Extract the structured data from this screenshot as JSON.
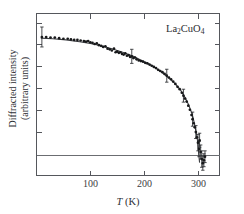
{
  "figure": {
    "background_color": "#ffffff",
    "frame_color": "#55575c",
    "point_color": "#17181a",
    "curve_color": "#3a3c40"
  },
  "annotations": {
    "sample_label": "La",
    "sample_sub_1": "2",
    "sample_mid": "CuO",
    "sample_sub_2": "4",
    "sample_label_full": "La2CuO4"
  },
  "axes": {
    "x": {
      "title_italic": "T",
      "title_rest": " (K)",
      "title_full": "T (K)",
      "ticks": [
        100,
        200,
        300
      ],
      "tick_labels": [
        "100",
        "200",
        "300"
      ],
      "range": [
        0,
        340
      ]
    },
    "y": {
      "title_line1": "Diffracted intensity",
      "title_line2": "(arbitrary units)",
      "tick_labels": [],
      "range": [
        -0.18,
        1.2
      ]
    }
  },
  "chart_data": {
    "type": "scatter",
    "title": "",
    "xlabel": "T (K)",
    "ylabel": "Diffracted intensity (arbitrary units)",
    "xlim": [
      0,
      340
    ],
    "ylim": [
      -0.18,
      1.2
    ],
    "grid": false,
    "legend": null,
    "annotation": "La2CuO4",
    "zero_line_y": 0,
    "series": [
      {
        "name": "Diffracted intensity data",
        "marker": "filled-circle",
        "x": [
          10,
          18,
          26,
          34,
          42,
          50,
          58,
          64,
          70,
          76,
          82,
          88,
          92,
          96,
          100,
          104,
          108,
          112,
          116,
          120,
          124,
          128,
          132,
          136,
          140,
          144,
          147,
          150,
          153,
          156,
          159,
          162,
          165,
          168,
          171,
          174,
          177,
          180,
          183,
          186,
          190,
          194,
          198,
          202,
          206,
          210,
          214,
          218,
          222,
          226,
          230,
          234,
          238,
          242,
          246,
          250,
          254,
          258,
          262,
          266,
          270,
          273,
          276,
          279,
          282,
          285,
          288,
          290,
          292,
          294,
          296,
          298,
          300,
          302,
          303,
          305,
          307,
          309,
          311,
          313
        ],
        "y": [
          1.0,
          1.0,
          0.995,
          0.995,
          0.99,
          0.985,
          0.985,
          0.98,
          0.975,
          0.975,
          0.97,
          0.965,
          0.96,
          0.965,
          0.955,
          0.95,
          0.94,
          0.945,
          0.93,
          0.925,
          0.915,
          0.92,
          0.9,
          0.895,
          0.885,
          0.9,
          0.87,
          0.875,
          0.865,
          0.87,
          0.855,
          0.85,
          0.86,
          0.84,
          0.845,
          0.83,
          0.835,
          0.82,
          0.825,
          0.81,
          0.8,
          0.795,
          0.79,
          0.78,
          0.775,
          0.765,
          0.755,
          0.745,
          0.735,
          0.72,
          0.71,
          0.7,
          0.685,
          0.67,
          0.655,
          0.64,
          0.62,
          0.6,
          0.575,
          0.555,
          0.525,
          0.5,
          0.475,
          0.45,
          0.415,
          0.38,
          0.335,
          0.3,
          0.265,
          0.23,
          0.19,
          0.145,
          0.1,
          0.045,
          0.12,
          0.02,
          -0.04,
          -0.075,
          -0.05,
          -0.02
        ],
        "yerr": [
          0.085,
          0,
          0,
          0,
          0,
          0,
          0,
          0,
          0,
          0,
          0,
          0,
          0,
          0,
          0,
          0,
          0,
          0,
          0,
          0,
          0,
          0,
          0,
          0,
          0,
          0,
          0,
          0,
          0,
          0,
          0,
          0,
          0,
          0,
          0,
          0,
          0.06,
          0,
          0,
          0,
          0,
          0,
          0,
          0,
          0,
          0,
          0,
          0,
          0,
          0,
          0,
          0,
          0,
          0.055,
          0,
          0,
          0,
          0,
          0,
          0,
          0,
          0.055,
          0,
          0,
          0,
          0,
          0,
          0.06,
          0,
          0,
          0.055,
          0,
          0.07,
          0.065,
          0.06,
          0.06,
          0.07,
          0.06,
          0.055,
          0.05
        ]
      }
    ],
    "fit_curve": {
      "name": "order-parameter fit",
      "description": "smooth curve decreasing to zero near the transition temperature",
      "x": [
        8,
        30,
        55,
        80,
        100,
        120,
        140,
        160,
        180,
        200,
        215,
        230,
        245,
        258,
        268,
        276,
        282,
        287,
        291,
        294,
        296,
        298,
        299.5,
        300.5,
        301.5,
        303
      ],
      "y": [
        0.99,
        0.985,
        0.975,
        0.96,
        0.945,
        0.925,
        0.9,
        0.87,
        0.835,
        0.79,
        0.755,
        0.71,
        0.655,
        0.6,
        0.545,
        0.485,
        0.43,
        0.37,
        0.31,
        0.25,
        0.205,
        0.15,
        0.105,
        0.05,
        0.0,
        -0.07
      ]
    }
  }
}
